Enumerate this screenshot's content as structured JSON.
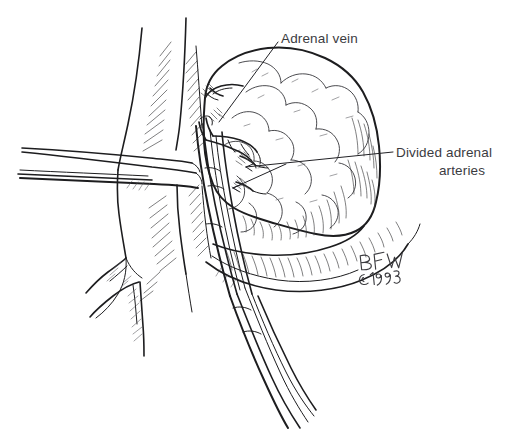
{
  "figure": {
    "medium": "pen-and-ink line drawing",
    "background_color": "#ffffff",
    "ink_color": "#1d1d1f",
    "width": 529,
    "height": 431
  },
  "labels": [
    {
      "id": "adrenal-vein",
      "text": "Adrenal vein",
      "x": 281,
      "y": 38,
      "align": "start",
      "leader": "from label start down-left across the gland to the clamped vein"
    },
    {
      "id": "divided-adrenal-arteries",
      "line1": "Divided adrenal",
      "line2": "arteries",
      "x1": 396,
      "y1": 152,
      "x2": 462,
      "y2": 170,
      "align": "start",
      "leader": "from label left edge running left, forking to two ligated artery stumps"
    }
  ],
  "signature": {
    "monogram": "BFW",
    "copyright": "©1993",
    "x": 360,
    "y": 262
  },
  "anatomy": [
    {
      "name": "adrenal-gland",
      "description": "lobulated suprarenal mass, upper right of field"
    },
    {
      "name": "inferior-vena-cava",
      "description": "large vertical vessel at left with hatched shading"
    },
    {
      "name": "vena-cava-branches",
      "description": "two branching vessels at lower left"
    },
    {
      "name": "perinephric-fat",
      "description": "shaded fatty tissue below and behind the gland"
    },
    {
      "name": "kidney-upper-pole",
      "description": "smooth rounded surface at lower right"
    }
  ],
  "instruments": [
    {
      "name": "retractor-blade",
      "description": "horizontal retractor entering from left edge"
    },
    {
      "name": "vascular-clamp",
      "description": "vertical clamp/forceps on the adrenal vein, shaft exits lower right"
    },
    {
      "name": "ligature-stumps",
      "description": "two tied-off divided adrenal artery stumps"
    }
  ]
}
